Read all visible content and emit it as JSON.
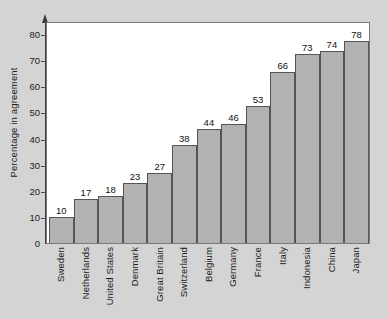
{
  "chart_data": {
    "type": "bar",
    "title": "",
    "xlabel": "",
    "ylabel": "Percentage in agreement",
    "ylim": [
      0,
      85
    ],
    "yticks": [
      0,
      10,
      20,
      30,
      40,
      50,
      60,
      70,
      80
    ],
    "ytick_labels": [
      "0",
      "10",
      "20",
      "30",
      "40",
      "50",
      "60",
      "70",
      "80"
    ],
    "grid": false,
    "legend": null,
    "categories": [
      "Sweden",
      "Netherlands",
      "United States",
      "Denmark",
      "Great Britain",
      "Switzerland",
      "Belgium",
      "Germany",
      "France",
      "Italy",
      "Indonesia",
      "China",
      "Japan"
    ],
    "values": [
      10,
      17,
      18,
      23,
      27,
      38,
      44,
      46,
      53,
      66,
      73,
      74,
      78
    ],
    "value_labels": [
      "10",
      "17",
      "18",
      "23",
      "27",
      "38",
      "44",
      "46",
      "53",
      "66",
      "73",
      "74",
      "78"
    ],
    "colors": {
      "bar_fill": "#b2b2b2",
      "bar_edge": "#555555",
      "plot_background": "#ffffff",
      "figure_background": "#d4d4d4",
      "axis": "#3a3a3a",
      "text": "#1c1c1c"
    }
  }
}
